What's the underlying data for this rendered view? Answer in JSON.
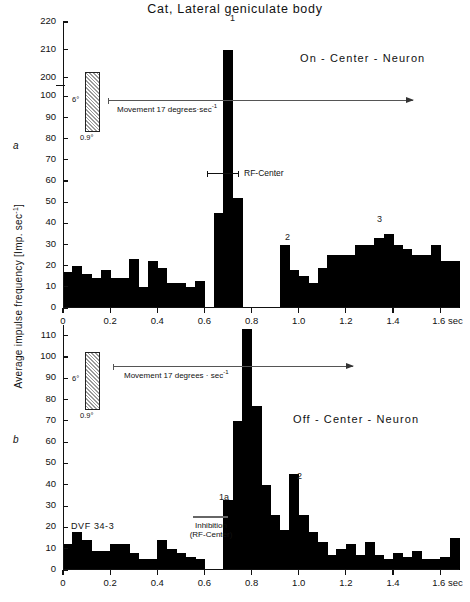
{
  "figure": {
    "title": "Cat, Lateral geniculate body",
    "ylabel": "Average  impulse  frequency  [Imp. sec",
    "ylabel_sup": "-1",
    "ylabel_close": "]",
    "panel_a_letter": "a",
    "panel_b_letter": "b"
  },
  "panel_a": {
    "neuron_label": "On - Center - Neuron",
    "stimulus": {
      "height_label": "6°",
      "width_label": "0.9°"
    },
    "movement_label": "Movement   17 degrees·sec",
    "movement_sup": "-1",
    "rf_label": "RF-Center",
    "peak_labels": [
      "1",
      "2",
      "3"
    ],
    "xaxis_unit": "sec"
  },
  "panel_b": {
    "neuron_label": "Off - Center - Neuron",
    "stimulus": {
      "height_label": "6°",
      "width_label": "0.9°"
    },
    "movement_label": "Movement   17 degrees · sec",
    "movement_sup": "-1",
    "experiment_id": "DVF 34-3",
    "inhibition_label_line1": "Inhibition",
    "inhibition_label_line2": "(RF-Center)",
    "peak_labels": [
      "1a",
      "2"
    ],
    "xaxis_unit": "sec"
  },
  "chart_data": [
    {
      "type": "bar",
      "panel": "a",
      "title": "Cat, Lateral geniculate body — On-Center-Neuron",
      "xlabel": "sec",
      "ylabel": "Average impulse frequency [Imp. sec-1]",
      "xlim": [
        0,
        1.68
      ],
      "ylim": [
        0,
        220
      ],
      "axis_break": {
        "between": [
          100,
          200
        ],
        "note": "y-axis compressed between 100 and 200"
      },
      "ytick_labels": [
        "0",
        "10",
        "20",
        "30",
        "40",
        "50",
        "60",
        "70",
        "80",
        "90",
        "100",
        "200",
        "210",
        "220"
      ],
      "ytick_values": [
        0,
        10,
        20,
        30,
        40,
        50,
        60,
        70,
        80,
        90,
        100,
        200,
        210,
        220
      ],
      "xtick_labels": [
        "0",
        "0.2",
        "0.4",
        "0.6",
        "0.8",
        "1.0",
        "1.2",
        "1.4",
        "1.6"
      ],
      "xtick_values": [
        0,
        0.2,
        0.4,
        0.6,
        0.8,
        1.0,
        1.2,
        1.4,
        1.6
      ],
      "bin_width": 0.04,
      "x": [
        0.0,
        0.04,
        0.08,
        0.12,
        0.16,
        0.2,
        0.24,
        0.28,
        0.32,
        0.36,
        0.4,
        0.44,
        0.48,
        0.52,
        0.56,
        0.6,
        0.64,
        0.68,
        0.72,
        0.76,
        0.8,
        0.84,
        0.88,
        0.92,
        0.96,
        1.0,
        1.04,
        1.08,
        1.12,
        1.16,
        1.2,
        1.24,
        1.28,
        1.32,
        1.36,
        1.4,
        1.44,
        1.48,
        1.52,
        1.56,
        1.6,
        1.64
      ],
      "values": [
        17,
        20,
        16,
        14,
        18,
        14,
        14,
        23,
        10,
        22,
        19,
        12,
        12,
        10,
        13,
        0,
        45,
        210,
        52,
        0,
        0,
        0,
        0,
        30,
        18,
        15,
        12,
        19,
        25,
        25,
        25,
        30,
        30,
        33,
        35,
        30,
        28,
        25,
        25,
        30,
        22,
        22
      ],
      "annotations": [
        {
          "text": "1",
          "x": 0.68,
          "y": 210
        },
        {
          "text": "2",
          "x": 0.92,
          "y": 30
        },
        {
          "text": "3",
          "x": 1.36,
          "y": 35
        },
        {
          "text": "RF-Center",
          "x": 0.7,
          "y": 65
        },
        {
          "text": "Movement 17 degrees sec-1",
          "x": 0.3,
          "y": 100
        }
      ],
      "grid": false,
      "legend": "none"
    },
    {
      "type": "bar",
      "panel": "b",
      "title": "Off-Center-Neuron",
      "xlabel": "sec",
      "ylabel": "Average impulse frequency [Imp. sec-1]",
      "xlim": [
        0,
        1.68
      ],
      "ylim": [
        0,
        115
      ],
      "axis_break": null,
      "ytick_labels": [
        "0",
        "10",
        "20",
        "30",
        "40",
        "50",
        "60",
        "70",
        "80",
        "90",
        "100",
        "110"
      ],
      "ytick_values": [
        0,
        10,
        20,
        30,
        40,
        50,
        60,
        70,
        80,
        90,
        100,
        110
      ],
      "xtick_labels": [
        "0",
        "0.2",
        "0.4",
        "0.6",
        "0.8",
        "1.0",
        "1.2",
        "1.4",
        "1.6"
      ],
      "xtick_values": [
        0,
        0.2,
        0.4,
        0.6,
        0.8,
        1.0,
        1.2,
        1.4,
        1.6
      ],
      "bin_width": 0.04,
      "x": [
        0.0,
        0.04,
        0.08,
        0.12,
        0.16,
        0.2,
        0.24,
        0.28,
        0.32,
        0.36,
        0.4,
        0.44,
        0.48,
        0.52,
        0.56,
        0.6,
        0.64,
        0.68,
        0.72,
        0.76,
        0.8,
        0.84,
        0.88,
        0.92,
        0.96,
        1.0,
        1.04,
        1.08,
        1.12,
        1.16,
        1.2,
        1.24,
        1.28,
        1.32,
        1.36,
        1.4,
        1.44,
        1.48,
        1.52,
        1.56,
        1.6,
        1.64
      ],
      "values": [
        12,
        18,
        14,
        9,
        9,
        12,
        12,
        8,
        5,
        5,
        14,
        10,
        8,
        6,
        5,
        0,
        0,
        33,
        70,
        113,
        77,
        40,
        26,
        19,
        45,
        26,
        18,
        13,
        7,
        10,
        12,
        7,
        13,
        7,
        5,
        8,
        6,
        9,
        5,
        5,
        6,
        15
      ],
      "annotations": [
        {
          "text": "1a",
          "x": 0.68,
          "y": 33
        },
        {
          "text": "2",
          "x": 0.96,
          "y": 45
        },
        {
          "text": "Inhibition (RF-Center)",
          "x": 0.58,
          "y": 26
        },
        {
          "text": "DVF 34-3",
          "x": 0.06,
          "y": 26
        },
        {
          "text": "Movement 17 degrees sec-1",
          "x": 0.3,
          "y": 92
        }
      ],
      "grid": false,
      "legend": "none"
    }
  ]
}
